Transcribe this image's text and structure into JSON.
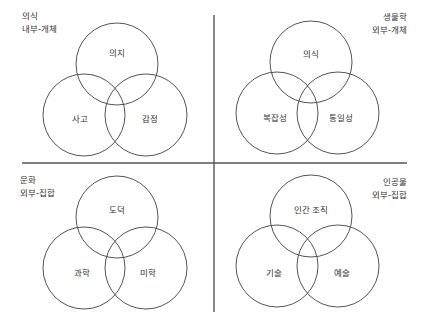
{
  "diagram": {
    "type": "four-quadrant venn diagrams",
    "axes": {
      "vertical": {
        "x": 214,
        "y1": 15,
        "y2": 312
      },
      "horizontal": {
        "y": 163,
        "x1": 22,
        "x2": 407
      },
      "color": "#555555"
    },
    "quadrants": [
      {
        "id": "top-left",
        "title": "의식",
        "subtitle": "내부-개체",
        "circles": [
          {
            "label": "의지",
            "cx": 117,
            "cy": 64,
            "r": 41
          },
          {
            "label": "사고",
            "cx": 84,
            "cy": 115,
            "r": 41
          },
          {
            "label": "감정",
            "cx": 146,
            "cy": 115,
            "r": 41
          }
        ]
      },
      {
        "id": "top-right",
        "title": "생물학",
        "subtitle": "외부-개체",
        "circles": [
          {
            "label": "의식",
            "cx": 311,
            "cy": 62,
            "r": 41
          },
          {
            "label": "복잡성",
            "cx": 277,
            "cy": 113,
            "r": 41
          },
          {
            "label": "통일성",
            "cx": 338,
            "cy": 113,
            "r": 41
          }
        ]
      },
      {
        "id": "bottom-left",
        "title": "문화",
        "subtitle": "외부-집합",
        "circles": [
          {
            "label": "도덕",
            "cx": 117,
            "cy": 217,
            "r": 41
          },
          {
            "label": "과학",
            "cx": 84,
            "cy": 268,
            "r": 41
          },
          {
            "label": "미학",
            "cx": 146,
            "cy": 268,
            "r": 41
          }
        ]
      },
      {
        "id": "bottom-right",
        "title": "인공물",
        "subtitle": "외부-집합",
        "circles": [
          {
            "label": "인간 조직",
            "cx": 311,
            "cy": 216,
            "r": 41
          },
          {
            "label": "기술",
            "cx": 277,
            "cy": 266,
            "r": 41
          },
          {
            "label": "예술",
            "cx": 338,
            "cy": 266,
            "r": 41
          }
        ]
      }
    ]
  }
}
